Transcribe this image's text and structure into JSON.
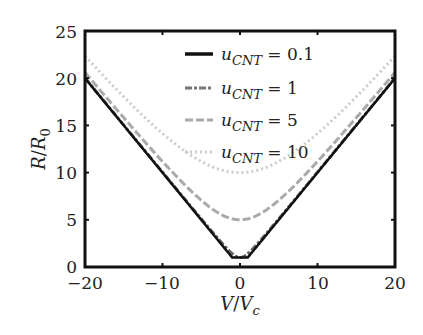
{
  "chart_data": {
    "type": "line",
    "title": "",
    "xlabel": "V/V_c",
    "ylabel": "R/R_0",
    "xlim": [
      -20,
      20
    ],
    "ylim": [
      0,
      25
    ],
    "xticks": [
      -20,
      -10,
      0,
      10,
      20
    ],
    "yticks": [
      0,
      5,
      10,
      15,
      20,
      25
    ],
    "grid": false,
    "legend_position": "upper center",
    "formula_hint": "R/R0 = sqrt(u_CNT^2 + (V/Vc)^2) (approx.)",
    "series": [
      {
        "name": "u_CNT = 0.1",
        "u": 0.1,
        "style": "solid",
        "color": "#111111",
        "x": [
          -20,
          -10,
          -5,
          -2,
          -1,
          0,
          1,
          2,
          5,
          10,
          20
        ],
        "values": [
          20,
          10,
          5,
          2,
          1,
          1,
          1,
          2,
          5,
          10,
          20
        ]
      },
      {
        "name": "u_CNT = 1",
        "u": 1,
        "style": "dash-dot",
        "color": "#666666",
        "x": [
          -20,
          -10,
          -5,
          -2,
          -1,
          0,
          1,
          2,
          5,
          10,
          20
        ],
        "values": [
          20,
          10,
          5.1,
          2.2,
          1.4,
          1,
          1.4,
          2.2,
          5.1,
          10,
          20
        ]
      },
      {
        "name": "u_CNT = 5",
        "u": 5,
        "style": "dashed",
        "color": "#aaaaaa",
        "x": [
          -20,
          -10,
          -5,
          -2,
          0,
          2,
          5,
          10,
          20
        ],
        "values": [
          20.6,
          11.2,
          7.1,
          5.4,
          5,
          5.4,
          7.1,
          11.2,
          20.6
        ]
      },
      {
        "name": "u_CNT = 10",
        "u": 10,
        "style": "dotted",
        "color": "#cccccc",
        "x": [
          -20,
          -10,
          -5,
          0,
          5,
          10,
          20
        ],
        "values": [
          22.4,
          14.1,
          11.2,
          10,
          11.2,
          14.1,
          22.4
        ]
      }
    ]
  },
  "axes": {
    "x_ticks": [
      "−20",
      "−10",
      "0",
      "10",
      "20"
    ],
    "y_ticks": [
      "0",
      "5",
      "10",
      "15",
      "20",
      "25"
    ],
    "x_label_main": "V",
    "x_label_slash": "/",
    "x_label_sub_base": "V",
    "x_label_sub": "c",
    "y_label_main": "R",
    "y_label_slash": "/",
    "y_label_sub_base": "R",
    "y_label_sub": "0"
  },
  "legend": {
    "items": [
      {
        "var": "u",
        "sub": "CNT",
        "eq": " = 0.1"
      },
      {
        "var": "u",
        "sub": "CNT",
        "eq": " = 1"
      },
      {
        "var": "u",
        "sub": "CNT",
        "eq": " = 5"
      },
      {
        "var": "u",
        "sub": "CNT",
        "eq": " = 10"
      }
    ]
  }
}
